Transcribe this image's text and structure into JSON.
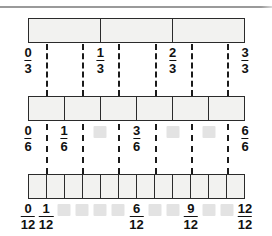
{
  "page": {
    "background_color": "#ffffff",
    "rule_color": "#9a9a9a",
    "bar_fill_color": "#f2f2f0",
    "bar_stroke_color": "#2b2b2b",
    "dash_color": "#1b1b1b",
    "blank_box_color": "#e3e3e3"
  },
  "chart_data": {
    "type": "bar",
    "xlabel": "",
    "ylabel": "",
    "grid": false,
    "legend": "none",
    "xlim": [
      0,
      1
    ],
    "rows": [
      {
        "name": "thirds",
        "denominator": 3,
        "segments": 3,
        "tick_positions": [
          0,
          0.3333,
          0.6667,
          1
        ],
        "labels": [
          {
            "numerator": "0",
            "denominator": "3",
            "position": 0,
            "masked": false
          },
          {
            "numerator": "1",
            "denominator": "3",
            "position": 0.3333,
            "masked": false
          },
          {
            "numerator": "2",
            "denominator": "3",
            "position": 0.6667,
            "masked": false
          },
          {
            "numerator": "3",
            "denominator": "3",
            "position": 1,
            "masked": false
          }
        ]
      },
      {
        "name": "sixths",
        "denominator": 6,
        "segments": 6,
        "tick_positions": [
          0,
          0.1667,
          0.3333,
          0.5,
          0.6667,
          0.8333,
          1
        ],
        "labels": [
          {
            "numerator": "0",
            "denominator": "6",
            "position": 0,
            "masked": false
          },
          {
            "numerator": "1",
            "denominator": "6",
            "position": 0.1667,
            "masked": false
          },
          {
            "numerator": "2",
            "denominator": "6",
            "position": 0.3333,
            "masked": true
          },
          {
            "numerator": "3",
            "denominator": "6",
            "position": 0.5,
            "masked": false
          },
          {
            "numerator": "4",
            "denominator": "6",
            "position": 0.6667,
            "masked": true
          },
          {
            "numerator": "5",
            "denominator": "6",
            "position": 0.8333,
            "masked": true
          },
          {
            "numerator": "6",
            "denominator": "6",
            "position": 1,
            "masked": false
          }
        ]
      },
      {
        "name": "twelfths",
        "denominator": 12,
        "segments": 12,
        "tick_positions": [
          0,
          0.0833,
          0.1667,
          0.25,
          0.3333,
          0.4167,
          0.5,
          0.5833,
          0.6667,
          0.75,
          0.8333,
          0.9167,
          1
        ],
        "labels": [
          {
            "numerator": "0",
            "denominator": "12",
            "position": 0,
            "masked": false
          },
          {
            "numerator": "1",
            "denominator": "12",
            "position": 0.0833,
            "masked": false
          },
          {
            "numerator": "2",
            "denominator": "12",
            "position": 0.1667,
            "masked": true
          },
          {
            "numerator": "3",
            "denominator": "12",
            "position": 0.25,
            "masked": true
          },
          {
            "numerator": "4",
            "denominator": "12",
            "position": 0.3333,
            "masked": true
          },
          {
            "numerator": "5",
            "denominator": "12",
            "position": 0.4167,
            "masked": true
          },
          {
            "numerator": "6",
            "denominator": "12",
            "position": 0.5,
            "masked": false
          },
          {
            "numerator": "7",
            "denominator": "12",
            "position": 0.5833,
            "masked": true
          },
          {
            "numerator": "8",
            "denominator": "12",
            "position": 0.6667,
            "masked": true
          },
          {
            "numerator": "9",
            "denominator": "12",
            "position": 0.75,
            "masked": false
          },
          {
            "numerator": "10",
            "denominator": "12",
            "position": 0.8333,
            "masked": true
          },
          {
            "numerator": "11",
            "denominator": "12",
            "position": 0.9167,
            "masked": true
          },
          {
            "numerator": "12",
            "denominator": "12",
            "position": 1,
            "masked": false
          }
        ]
      }
    ],
    "dashed_connectors": [
      {
        "position": 0.0833,
        "from_y": 44,
        "to_y": 172
      },
      {
        "position": 0.25,
        "from_y": 44,
        "to_y": 172
      },
      {
        "position": 0.4167,
        "from_y": 44,
        "to_y": 172
      },
      {
        "position": 0.5833,
        "from_y": 44,
        "to_y": 172
      },
      {
        "position": 0.75,
        "from_y": 44,
        "to_y": 172
      },
      {
        "position": 0.9167,
        "from_y": 44,
        "to_y": 172
      }
    ]
  }
}
